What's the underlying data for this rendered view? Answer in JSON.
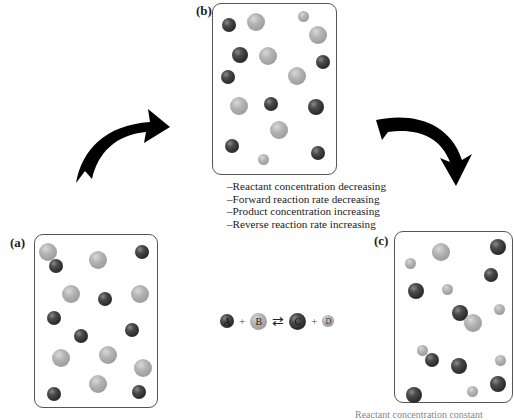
{
  "panels": {
    "a": {
      "label": "(a)"
    },
    "b": {
      "label": "(b)"
    },
    "c": {
      "label": "(c)"
    }
  },
  "notes": [
    "–Reactant concentration decreasing",
    "–Forward reaction rate decreasing",
    "–Product concentration increasing",
    "–Reverse reaction rate increasing"
  ],
  "equation": {
    "species": [
      "A",
      "B",
      "C",
      "D"
    ],
    "plus": "+",
    "arrow": "⇄"
  },
  "bottom_caption_fragment": "Reactant concentration constant",
  "colors": {
    "dark_particle": "#2e2e2e",
    "light_particle": "#a8a8a8",
    "arrow": "#000000",
    "panel_border": "#555555"
  }
}
